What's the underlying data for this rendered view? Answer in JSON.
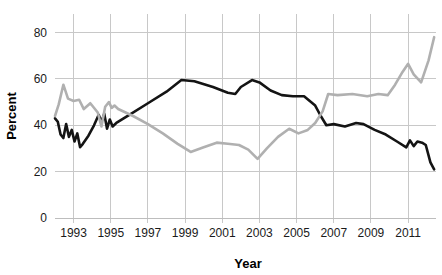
{
  "chart_data": {
    "type": "line",
    "title": "",
    "xlabel": "Year",
    "ylabel": "Percent",
    "xlim": [
      1992.0,
      2012.5
    ],
    "ylim": [
      0,
      88
    ],
    "grid": true,
    "legend_position": "none",
    "x_ticks": [
      1993,
      1995,
      1997,
      1999,
      2001,
      2003,
      2005,
      2007,
      2009,
      2011
    ],
    "x_tick_labels": [
      "1993",
      "1995",
      "1997",
      "1999",
      "2001",
      "2003",
      "2005",
      "2007",
      "2009",
      "2011"
    ],
    "y_ticks": [
      0,
      20,
      40,
      60,
      80
    ],
    "y_tick_labels": [
      "0",
      "20",
      "40",
      "60",
      "80"
    ],
    "series": [
      {
        "name": "black-series",
        "color": "#141414",
        "linewidth": 2.6,
        "x": [
          1992.0,
          1992.15,
          1992.3,
          1992.45,
          1992.6,
          1992.75,
          1992.9,
          1993.05,
          1993.2,
          1993.35,
          1993.5,
          1993.8,
          1994.1,
          1994.35,
          1994.5,
          1994.65,
          1994.8,
          1994.95,
          1995.1,
          1995.3,
          1996.0,
          1997.0,
          1998.0,
          1998.8,
          1999.5,
          2000.5,
          2001.3,
          2001.7,
          2002.0,
          2002.6,
          2003.0,
          2003.6,
          2004.2,
          2004.8,
          2005.4,
          2006.0,
          2006.3,
          2006.6,
          2007.0,
          2007.6,
          2008.2,
          2008.6,
          2009.2,
          2009.8,
          2010.4,
          2010.9,
          2011.1,
          2011.3,
          2011.5,
          2011.75,
          2011.95,
          2012.2,
          2012.4
        ],
        "y": [
          43.0,
          41.5,
          36.0,
          34.5,
          40.5,
          35.0,
          38.0,
          33.0,
          36.5,
          30.5,
          32.0,
          35.5,
          40.0,
          44.5,
          41.5,
          45.0,
          38.5,
          42.5,
          39.5,
          41.0,
          44.5,
          49.5,
          54.5,
          59.5,
          59.0,
          56.5,
          54.0,
          53.5,
          56.5,
          59.5,
          58.5,
          55.0,
          53.0,
          52.5,
          52.5,
          48.5,
          44.0,
          40.0,
          40.5,
          39.5,
          41.0,
          40.5,
          38.0,
          36.0,
          33.0,
          30.5,
          33.5,
          31.0,
          33.0,
          32.5,
          31.5,
          24.0,
          21.0
        ]
      },
      {
        "name": "gray-series",
        "color": "#b0b0b0",
        "linewidth": 2.6,
        "x": [
          1992.0,
          1992.2,
          1992.45,
          1992.7,
          1993.0,
          1993.3,
          1993.55,
          1993.9,
          1994.3,
          1994.5,
          1994.7,
          1994.9,
          1995.05,
          1995.2,
          1995.4,
          1996.2,
          1997.0,
          1997.8,
          1998.6,
          1999.3,
          2000.0,
          2000.7,
          2001.3,
          2001.9,
          2002.4,
          2002.9,
          2003.4,
          2004.0,
          2004.6,
          2005.1,
          2005.6,
          2006.0,
          2006.4,
          2006.7,
          2007.2,
          2008.0,
          2008.8,
          2009.4,
          2009.9,
          2010.3,
          2010.7,
          2011.0,
          2011.3,
          2011.7,
          2012.1,
          2012.4
        ],
        "y": [
          44.0,
          49.0,
          57.5,
          51.5,
          50.5,
          51.0,
          47.0,
          49.5,
          45.5,
          39.5,
          48.0,
          50.0,
          47.5,
          48.5,
          47.0,
          44.0,
          40.5,
          36.5,
          32.0,
          28.5,
          30.5,
          32.5,
          32.0,
          31.5,
          29.5,
          25.5,
          30.0,
          35.0,
          38.5,
          36.5,
          38.0,
          41.0,
          46.0,
          53.5,
          53.0,
          53.5,
          52.5,
          53.5,
          53.0,
          57.5,
          63.0,
          66.5,
          62.0,
          58.5,
          68.0,
          78.0
        ]
      }
    ]
  },
  "plot_geometry": {
    "left": 55,
    "right": 436,
    "top": 14,
    "bottom": 218
  }
}
